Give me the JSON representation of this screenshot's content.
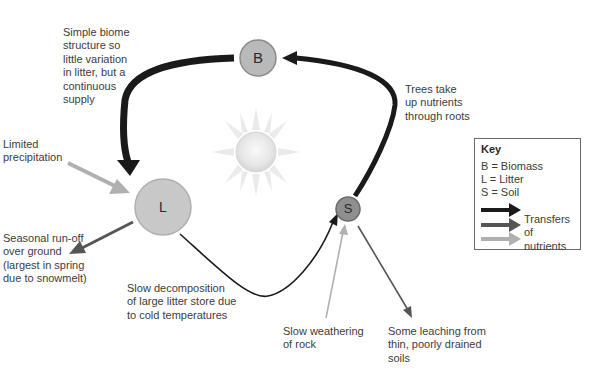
{
  "nodes": {
    "biomass": {
      "letter": "B",
      "fill": "#b9b9b9"
    },
    "litter": {
      "letter": "L",
      "fill": "#c8c8c8"
    },
    "soil": {
      "letter": "S",
      "fill": "#8f8f8f"
    }
  },
  "labels": {
    "biome_structure": "Simple biome\nstructure so\nlittle variation\nin litter, but a\ncontinuous\nsupply",
    "trees_uptake": "Trees take\nup nutrients\nthrough roots",
    "precipitation": "Limited\nprecipitation",
    "runoff": "Seasonal run-off\nover ground\n(largest in spring\ndue to snowmelt)",
    "decomposition": "Slow decomposition\nof large litter store due\nto cold temperatures",
    "weathering": "Slow weathering\nof rock",
    "leaching": "Some leaching from\nthin, poorly drained\nsoils"
  },
  "key": {
    "title": "Key",
    "items": [
      "B = Biomass",
      "L = Litter",
      "S = Soil"
    ],
    "transfer_label": "Transfers of\nnutrients",
    "arrow_colors": [
      "#1a1a1a",
      "#555555",
      "#b0b0b0"
    ]
  },
  "colors": {
    "major_flow": "#1a1a1a",
    "medium_flow": "#555555",
    "minor_flow": "#b0b0b0"
  }
}
